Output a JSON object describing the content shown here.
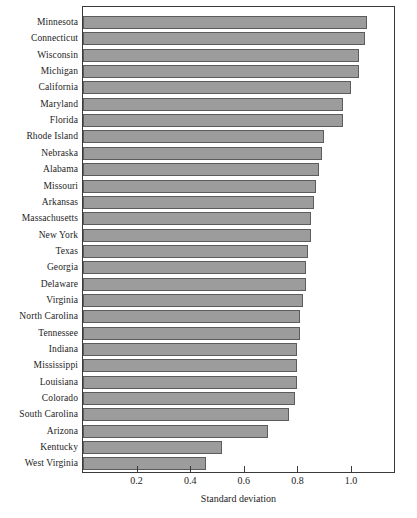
{
  "chart_data": {
    "type": "bar",
    "orientation": "horizontal",
    "title": "",
    "subtitle": "",
    "xlabel": "Standard deviation",
    "ylabel": "",
    "xlim": [
      0,
      1.16
    ],
    "ylim": null,
    "grid": false,
    "legend": null,
    "legend_position": "none",
    "xticks": [
      0.2,
      0.4,
      0.6,
      0.8,
      1.0
    ],
    "xticklabels": [
      "0.2",
      "0.4",
      "0.6",
      "0.8",
      "1.0"
    ],
    "bar_color": "#9c9c9c",
    "bar_edge_color": "#5c5c5c",
    "frame_color": "#3a3a3a",
    "categories": [
      "Minnesota",
      "Connecticut",
      "Wisconsin",
      "Michigan",
      "California",
      "Maryland",
      "Florida",
      "Rhode Island",
      "Nebraska",
      "Alabama",
      "Missouri",
      "Arkansas",
      "Massachusetts",
      "New York",
      "Texas",
      "Georgia",
      "Delaware",
      "Virginia",
      "North Carolina",
      "Tennessee",
      "Indiana",
      "Mississippi",
      "Louisiana",
      "Colorado",
      "South Carolina",
      "Arizona",
      "Kentucky",
      "West Virginia"
    ],
    "values": [
      1.06,
      1.05,
      1.03,
      1.03,
      1.0,
      0.97,
      0.97,
      0.9,
      0.89,
      0.88,
      0.87,
      0.86,
      0.85,
      0.85,
      0.84,
      0.83,
      0.83,
      0.82,
      0.81,
      0.81,
      0.8,
      0.8,
      0.8,
      0.79,
      0.77,
      0.69,
      0.52,
      0.46
    ]
  }
}
